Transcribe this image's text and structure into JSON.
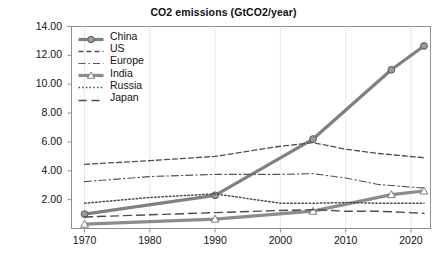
{
  "chart_data": {
    "type": "line",
    "title": "CO2 emissions (GtCO2/year)",
    "xlabel": "",
    "ylabel": "",
    "xlim": [
      1968,
      2023
    ],
    "ylim": [
      0,
      14
    ],
    "yticks": [
      "2.00",
      "4.00",
      "6.00",
      "8.00",
      "10.00",
      "12.00",
      "14.00"
    ],
    "ytick_values": [
      2,
      4,
      6,
      8,
      10,
      12,
      14
    ],
    "xticks": [
      "1970",
      "1980",
      "1990",
      "2000",
      "2010",
      "2020"
    ],
    "xtick_values": [
      1970,
      1980,
      1990,
      2000,
      2010,
      2020
    ],
    "grid": false,
    "legend_position": "upper-left-inside",
    "series": [
      {
        "name": "China",
        "style": "solid-marker",
        "marker": "circle",
        "color": "#808080",
        "x": [
          1970,
          1990,
          2005,
          2017,
          2022
        ],
        "values": [
          1.0,
          2.3,
          6.2,
          11.0,
          12.65
        ]
      },
      {
        "name": "US",
        "style": "dashed",
        "marker": "none",
        "color": "#4d4d4d",
        "x": [
          1970,
          1980,
          1990,
          2000,
          2005,
          2010,
          2015,
          2022
        ],
        "values": [
          4.45,
          4.7,
          5.0,
          5.7,
          5.95,
          5.5,
          5.2,
          4.9
        ]
      },
      {
        "name": "Europe",
        "style": "dash-dot",
        "marker": "none",
        "color": "#555555",
        "x": [
          1970,
          1980,
          1990,
          2000,
          2005,
          2010,
          2015,
          2022
        ],
        "values": [
          3.25,
          3.6,
          3.75,
          3.75,
          3.8,
          3.5,
          3.05,
          2.8
        ]
      },
      {
        "name": "India",
        "style": "solid-marker",
        "marker": "triangle",
        "color": "#8c8c8c",
        "x": [
          1970,
          1990,
          2005,
          2017,
          2022
        ],
        "values": [
          0.3,
          0.65,
          1.2,
          2.35,
          2.6
        ]
      },
      {
        "name": "Russia",
        "style": "dotted",
        "marker": "none",
        "color": "#4d4d4d",
        "x": [
          1970,
          1980,
          1990,
          2000,
          2005,
          2010,
          2015,
          2022
        ],
        "values": [
          1.75,
          2.15,
          2.4,
          1.75,
          1.75,
          1.8,
          1.75,
          1.75
        ]
      },
      {
        "name": "Japan",
        "style": "long-dash",
        "marker": "none",
        "color": "#4d4d4d",
        "x": [
          1970,
          1980,
          1990,
          2000,
          2005,
          2010,
          2015,
          2022
        ],
        "values": [
          0.8,
          0.95,
          1.1,
          1.25,
          1.3,
          1.2,
          1.2,
          1.05
        ]
      }
    ]
  },
  "axis": {
    "y_labels": [
      "14.00",
      "12.00",
      "10.00",
      "8.00",
      "6.00",
      "4.00",
      "2.00"
    ],
    "x_labels": [
      "1970",
      "1980",
      "1990",
      "2000",
      "2010",
      "2020"
    ]
  },
  "legend": {
    "items": [
      {
        "label": "China"
      },
      {
        "label": "US"
      },
      {
        "label": "Europe"
      },
      {
        "label": "India"
      },
      {
        "label": "Russia"
      },
      {
        "label": "Japan"
      }
    ]
  },
  "colors": {
    "china": "#808080",
    "india": "#8c8c8c",
    "dark_line": "#4d4d4d",
    "axis": "#8f8f8f",
    "text": "#111111"
  }
}
